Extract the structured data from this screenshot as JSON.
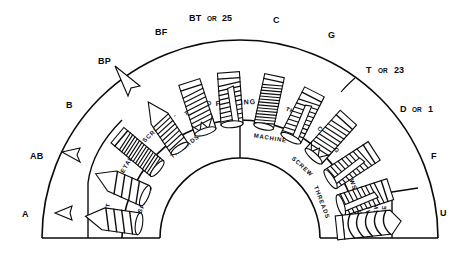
{
  "figure": {
    "background_color": "#ffffff",
    "ink_color": "#0a0a0a",
    "geometry": {
      "center_x": 240,
      "center_y": 238,
      "outer_radius": 198,
      "band_outer_radius": 118,
      "band_inner_radius": 80,
      "baseline_y": 238
    }
  },
  "point_labels": [
    {
      "id": "label-a",
      "text": "A",
      "alt": "",
      "x": 22,
      "y": 213,
      "leader": true
    },
    {
      "id": "label-ab",
      "text": "AB",
      "alt": "",
      "x": 30,
      "y": 155,
      "leader": true
    },
    {
      "id": "label-b",
      "text": "B",
      "alt": "",
      "x": 66,
      "y": 104,
      "leader": false
    },
    {
      "id": "label-bp",
      "text": "BP",
      "alt": "",
      "x": 98,
      "y": 60,
      "leader": true
    },
    {
      "id": "label-bf",
      "text": "BF",
      "alt": "",
      "x": 155,
      "y": 31,
      "leader": false
    },
    {
      "id": "label-bt",
      "text": "BT",
      "alt": "25",
      "x": 191,
      "y": 17,
      "leader": false
    },
    {
      "id": "label-c",
      "text": "C",
      "alt": "",
      "x": 273,
      "y": 19,
      "leader": false
    },
    {
      "id": "label-g",
      "text": "G",
      "alt": "",
      "x": 328,
      "y": 34,
      "leader": false
    },
    {
      "id": "label-t",
      "text": "T",
      "alt": "23",
      "x": 366,
      "y": 69,
      "leader": false
    },
    {
      "id": "label-d",
      "text": "D",
      "alt": "1",
      "x": 402,
      "y": 108,
      "leader": false
    },
    {
      "id": "label-f",
      "text": "F",
      "alt": "",
      "x": 431,
      "y": 155,
      "leader": false
    },
    {
      "id": "label-u",
      "text": "U",
      "alt": "",
      "x": 440,
      "y": 212,
      "leader": false
    }
  ],
  "or_word": "OR",
  "band_labels": {
    "outer_ring_left": [
      "SHEET",
      "METAL",
      "SCREWS",
      "-",
      "THREAD"
    ],
    "outer_ring_right": [
      "FORMING",
      "&",
      "THREAD",
      "CUTTING",
      "SCREWS"
    ],
    "inner_ring_left": [
      "SPACED",
      "THREADS"
    ],
    "inner_ring_right": [
      "MACHINE",
      "SCREW",
      "THREADS"
    ],
    "bottom_right_cells": [
      "SPIRAL THREAD",
      "DRIVE SCREW"
    ]
  },
  "band_text": {
    "sheet": "SHEET",
    "metal": "METAL",
    "screws_left": "SCREWS",
    "dash": "-",
    "thread_left": "THREAD",
    "forming": "FORMING",
    "amp": "&",
    "thread_right": "THREAD",
    "cutting": "CUTTING",
    "screws_right": "SCREWS",
    "spaced": "SPACED",
    "threads_left": "THREADS",
    "machine": "MACHINE",
    "screw": "SCREW",
    "threads_right": "THREADS",
    "spiral": "SPIRAL",
    "thread_cell": "THREAD",
    "drive": "DRIVE",
    "screw_cell": "SCREW"
  },
  "screws": [
    {
      "id": "screw-a",
      "label": "A",
      "angle": 172,
      "style": "pointed-coarse"
    },
    {
      "id": "screw-ab",
      "label": "AB",
      "angle": 156,
      "style": "pointed-coarse"
    },
    {
      "id": "screw-b",
      "label": "B",
      "angle": 140,
      "style": "blunt-fine"
    },
    {
      "id": "screw-bp",
      "label": "BP",
      "angle": 124,
      "style": "pointed-fine"
    },
    {
      "id": "screw-bf",
      "label": "BF",
      "angle": 108,
      "style": "blunt-notch"
    },
    {
      "id": "screw-bt",
      "label": "BT",
      "angle": 94,
      "style": "blunt-slot"
    },
    {
      "id": "screw-c",
      "label": "C",
      "angle": 78,
      "style": "blunt-fine"
    },
    {
      "id": "screw-g",
      "label": "G",
      "angle": 63,
      "style": "blunt-slot"
    },
    {
      "id": "screw-t",
      "label": "T",
      "angle": 48,
      "style": "blunt-notch"
    },
    {
      "id": "screw-d",
      "label": "D",
      "angle": 33,
      "style": "blunt-slot"
    },
    {
      "id": "screw-f",
      "label": "F",
      "angle": 18,
      "style": "blunt-slot"
    },
    {
      "id": "screw-u",
      "label": "U",
      "angle": 5,
      "style": "spiral-drive"
    }
  ]
}
